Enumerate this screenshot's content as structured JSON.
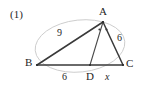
{
  "figure": {
    "item_number": "(1)",
    "type": "geometry-diagram",
    "stroke_color": "#3a3a3a",
    "faint_circle_color": "#c9c9c9",
    "background": "#ffffff"
  },
  "vertices": [
    {
      "id": "A",
      "label": "A",
      "x": 103,
      "y": 22
    },
    {
      "id": "B",
      "label": "B",
      "x": 37,
      "y": 65
    },
    {
      "id": "C",
      "label": "C",
      "x": 123,
      "y": 65
    },
    {
      "id": "D",
      "label": "D",
      "x": 90,
      "y": 65
    }
  ],
  "vertex_labels": [
    {
      "name": "vertex-label-A",
      "text": "A",
      "left": 99,
      "top": 6
    },
    {
      "name": "vertex-label-B",
      "text": "B",
      "left": 25,
      "top": 57
    },
    {
      "name": "vertex-label-C",
      "text": "C",
      "left": 126,
      "top": 58
    },
    {
      "name": "vertex-label-D",
      "text": "D",
      "left": 86,
      "top": 71
    }
  ],
  "segment_labels": [
    {
      "name": "length-label-ab",
      "text": "9",
      "left": 57,
      "top": 28,
      "kind": "len",
      "segment": "AB"
    },
    {
      "name": "length-label-ac",
      "text": "6",
      "left": 117,
      "top": 33,
      "kind": "len",
      "segment": "AC"
    },
    {
      "name": "length-label-bd",
      "text": "6",
      "left": 62,
      "top": 72,
      "kind": "len",
      "segment": "BD"
    },
    {
      "name": "length-label-dc",
      "text": "x",
      "left": 105,
      "top": 72,
      "kind": "var",
      "segment": "DC"
    }
  ],
  "angle_marks": {
    "name": "equal-angle-marks-at-a",
    "count": 2,
    "meaning": "AD bisects angle BAC",
    "points": [
      {
        "x": 99.5,
        "y": 29.5
      },
      {
        "x": 106.5,
        "y": 29.5
      }
    ]
  },
  "circle": {
    "name": "circumscribed-circle",
    "cx": 80,
    "cy": 46,
    "rx": 45,
    "ry": 26,
    "rotation": -6
  }
}
